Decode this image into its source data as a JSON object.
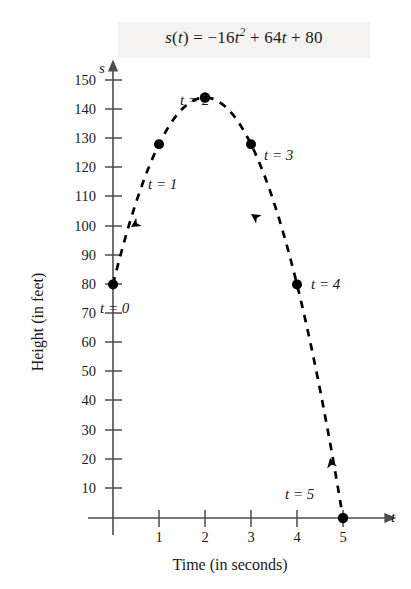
{
  "figure": {
    "formula_plain": "s(t) = -16t^2 + 64t + 80",
    "formula_parts": {
      "lhs_s": "s",
      "lhs_open": "(",
      "lhs_t": "t",
      "lhs_close": ")",
      "equals": "=",
      "term1_coef": "−16",
      "term1_var": "t",
      "term1_exp": "2",
      "plus1": "+",
      "term2": "64",
      "term2_var": "t",
      "plus2": "+",
      "term3": "80"
    }
  },
  "axes": {
    "x_title": "Time (in seconds)",
    "y_title": "Height (in feet)",
    "x_symbol": "t",
    "y_symbol": "s",
    "x_ticks": [
      "1",
      "2",
      "3",
      "4",
      "5"
    ],
    "y_ticks": [
      "150",
      "140",
      "130",
      "120",
      "110",
      "100",
      "90",
      "80",
      "70",
      "60",
      "50",
      "40",
      "30",
      "20",
      "10"
    ]
  },
  "annotations": [
    {
      "label": "t = 0"
    },
    {
      "label": "t = 1"
    },
    {
      "label": "t = 2"
    },
    {
      "label": "t = 3"
    },
    {
      "label": "t = 4"
    },
    {
      "label": "t = 5"
    }
  ],
  "colors": {
    "curve": "#000000",
    "axis": "#4d4d4d",
    "text": "#1a1a1a",
    "band": "#f4f3f1"
  },
  "chart_data": {
    "type": "line",
    "xlabel": "Time (in seconds)",
    "ylabel": "Height (in feet)",
    "xlim": [
      0,
      5.4
    ],
    "ylim": [
      0,
      158
    ],
    "grid": false,
    "legend": "none",
    "linestyle": "dashed",
    "x": [
      0,
      1,
      2,
      3,
      4,
      5
    ],
    "values": [
      80,
      128,
      144,
      128,
      80,
      0
    ],
    "point_labels": [
      "t = 0",
      "t = 1",
      "t = 2",
      "t = 3",
      "t = 4",
      "t = 5"
    ],
    "x_tick_values": [
      1,
      2,
      3,
      4,
      5
    ],
    "y_tick_values": [
      10,
      20,
      30,
      40,
      50,
      60,
      70,
      80,
      90,
      100,
      110,
      120,
      130,
      140,
      150
    ],
    "annotations": [
      {
        "text": "direction arrow (ascending)",
        "at_t": 0.75
      },
      {
        "text": "direction arrow (descending)",
        "at_t": 2.6
      },
      {
        "text": "direction arrow (descending)",
        "at_t": 4.55
      }
    ]
  }
}
